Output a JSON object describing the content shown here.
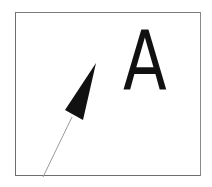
{
  "diagram": {
    "frame": {
      "stroke": "#6e6e6e"
    },
    "label": "A",
    "arrow": {
      "fill": "#111111",
      "tip": [
        96,
        63
      ],
      "base_left": [
        65,
        110
      ],
      "base_right": [
        83,
        120
      ]
    },
    "tail_line": {
      "stroke": "#9a9a9a",
      "from": [
        72,
        117
      ],
      "to": [
        43,
        177
      ]
    }
  }
}
